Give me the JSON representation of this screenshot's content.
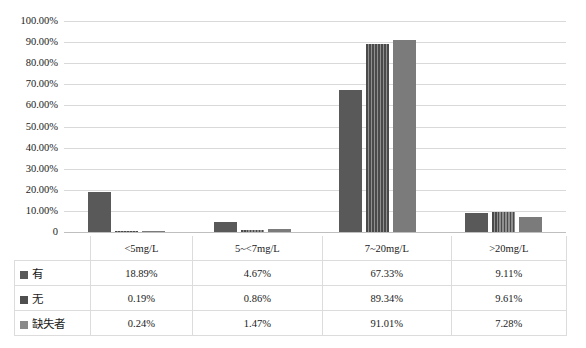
{
  "chart_data": {
    "type": "bar",
    "title": "",
    "subtitle": "",
    "xlabel": "",
    "ylabel": "",
    "categories": [
      "<5mg/L",
      "5~<7mg/L",
      "7~20mg/L",
      ">20mg/L"
    ],
    "series": [
      {
        "name": "有",
        "values": [
          18.89,
          4.67,
          67.33,
          9.11
        ],
        "labels": [
          "18.89%",
          "4.67%",
          "67.33%",
          "9.11%"
        ],
        "color": "#595959",
        "fill": "solid",
        "swatch_name": "legend-swatch-you"
      },
      {
        "name": "无",
        "values": [
          0.19,
          0.86,
          89.34,
          9.61
        ],
        "labels": [
          "0.19%",
          "0.86%",
          "89.34%",
          "9.61%"
        ],
        "color": "#4f4f4f",
        "fill": "vertical-stripes",
        "swatch_name": "legend-swatch-wu"
      },
      {
        "name": "缺失者",
        "values": [
          0.24,
          1.47,
          91.01,
          7.28
        ],
        "labels": [
          "0.24%",
          "1.47%",
          "91.01%",
          "7.28%"
        ],
        "color": "#7b7b7b",
        "fill": "solid",
        "swatch_name": "legend-swatch-que"
      }
    ],
    "ylim": [
      0,
      100
    ],
    "yticks": [
      0,
      10,
      20,
      30,
      40,
      50,
      60,
      70,
      80,
      90,
      100
    ],
    "ytick_labels": [
      "0",
      "10.00%",
      "20.00%",
      "30.00%",
      "40.00%",
      "50.00%",
      "60.00%",
      "70.00%",
      "80.00%",
      "90.00%",
      "100.00%"
    ],
    "grid": "horizontal",
    "legend_position": "data-table-left",
    "unit": "%"
  },
  "axis": {
    "y_labels": [
      "100.00%",
      "90.00%",
      "80.00%",
      "70.00%",
      "60.00%",
      "50.00%",
      "40.00%",
      "30.00%",
      "20.00%",
      "10.00%",
      "0"
    ]
  },
  "table": {
    "category_row": [
      "<5mg/L",
      "5~<7mg/L",
      "7~20mg/L",
      ">20mg/L"
    ],
    "rows": [
      {
        "label": "有",
        "swatch": "dark-gray",
        "values": [
          "18.89%",
          "4.67%",
          "67.33%",
          "9.11%"
        ]
      },
      {
        "label": "无",
        "swatch": "dark-gray",
        "values": [
          "0.19%",
          "0.86%",
          "89.34%",
          "9.61%"
        ]
      },
      {
        "label": "缺失者",
        "swatch": "light-gray",
        "values": [
          "0.24%",
          "1.47%",
          "91.01%",
          "7.28%"
        ]
      }
    ]
  },
  "colors": {
    "series_you": "#595959",
    "series_wu": "#4f4f4f",
    "series_que": "#7b7b7b",
    "gridline": "#d9d9d9",
    "table_border": "#dcdcdc",
    "text": "#1a1a1a",
    "background": "#ffffff"
  }
}
